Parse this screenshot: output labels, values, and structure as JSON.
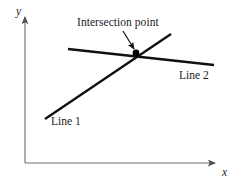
{
  "figure": {
    "kind": "line-intersection-diagram",
    "background_color": "#ffffff",
    "axes": {
      "color": "#6e6e72",
      "x_axis_label": "x",
      "y_axis_label": "y",
      "origin_px": [
        25,
        163
      ],
      "x_axis_end_px": [
        219,
        163
      ],
      "y_axis_end_px": [
        25,
        13
      ],
      "arrowheads": [
        "x-axis-end",
        "y-axis-end"
      ],
      "ticks": [],
      "grid": false
    },
    "lines": [
      {
        "name": "Line 1",
        "label": "Line 1",
        "label_position_px": [
          51,
          116
        ],
        "color": "#111111",
        "width_px": 2.4,
        "start_px": [
          45,
          119
        ],
        "end_px": [
          171,
          34
        ],
        "direction": "ascending-left-to-right"
      },
      {
        "name": "Line 2",
        "label": "Line 2",
        "label_position_px": [
          179,
          70
        ],
        "color": "#111111",
        "width_px": 2.4,
        "start_px": [
          68,
          49
        ],
        "end_px": [
          214,
          65
        ],
        "direction": "slightly-descending-left-to-right"
      }
    ],
    "intersection": {
      "label": "Intersection point",
      "marker": "filled-dot",
      "marker_color": "#000000",
      "marker_radius_px": 3.4,
      "point_px": [
        136,
        53
      ],
      "annotation_text_position_px": [
        77,
        17
      ],
      "leader_arrow": {
        "from_px": [
          123,
          31
        ],
        "to_px": [
          134,
          49
        ],
        "color": "#111111",
        "width_px": 1.2,
        "arrowhead": true
      }
    }
  },
  "chart_data": {
    "type": "line",
    "title": "",
    "subtitle": "",
    "xlabel": "x",
    "ylabel": "y",
    "grid": false,
    "legend_position": "inline-labels",
    "annotations": [
      {
        "text": "Intersection point",
        "points_to": "intersection-of-line-1-and-line-2"
      }
    ],
    "series": [
      {
        "name": "Line 1",
        "x": [
          0.103,
          0.649
        ],
        "y": [
          0.293,
          0.86
        ]
      },
      {
        "name": "Line 2",
        "x": [
          0.222,
          0.974
        ],
        "y": [
          0.76,
          0.653
        ]
      }
    ],
    "xlim": [
      0,
      1
    ],
    "ylim": [
      0,
      1
    ],
    "xticks": [],
    "yticks": [],
    "intersection_point": {
      "x": 0.572,
      "y": 0.733
    }
  }
}
